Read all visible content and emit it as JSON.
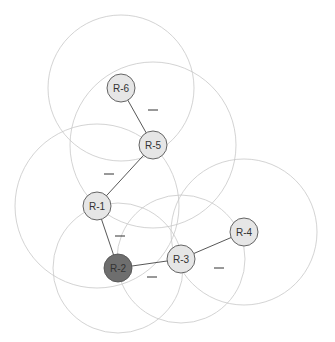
{
  "diagram": {
    "title": "",
    "colors": {
      "range_stroke": "#c8c8c8",
      "link_stroke": "#444444",
      "node_fill": "#e6e6e6",
      "node_fill_selected": "#6e6e6e",
      "node_stroke": "#555555",
      "label_color": "#333333"
    },
    "nodes": [
      {
        "id": "R-1",
        "label": "R-1",
        "x": 97,
        "y": 206,
        "range": 82,
        "selected": false
      },
      {
        "id": "R-2",
        "label": "R-2",
        "x": 118,
        "y": 268,
        "range": 65,
        "selected": true
      },
      {
        "id": "R-3",
        "label": "R-3",
        "x": 181,
        "y": 259,
        "range": 64,
        "selected": false
      },
      {
        "id": "R-4",
        "label": "R-4",
        "x": 244,
        "y": 232,
        "range": 73,
        "selected": false
      },
      {
        "id": "R-5",
        "label": "R-5",
        "x": 153,
        "y": 145,
        "range": 83,
        "selected": false
      },
      {
        "id": "R-6",
        "label": "R-6",
        "x": 121,
        "y": 88,
        "range": 73,
        "selected": false
      }
    ],
    "links": [
      {
        "from": "R-6",
        "to": "R-5",
        "label": "—",
        "label_x": 153,
        "label_y": 110
      },
      {
        "from": "R-5",
        "to": "R-1",
        "label": "—",
        "label_x": 109,
        "label_y": 174
      },
      {
        "from": "R-1",
        "to": "R-2",
        "label": "—",
        "label_x": 120,
        "label_y": 236
      },
      {
        "from": "R-2",
        "to": "R-3",
        "label": "—",
        "label_x": 152,
        "label_y": 277
      },
      {
        "from": "R-3",
        "to": "R-4",
        "label": "—",
        "label_x": 219,
        "label_y": 268
      }
    ]
  }
}
